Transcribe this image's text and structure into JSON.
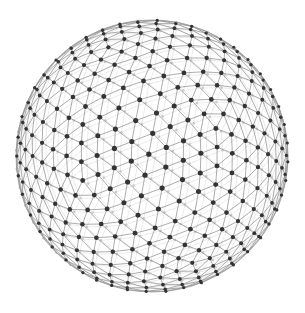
{
  "image": {
    "subject": "geodesic wireframe sphere",
    "background": "#ffffff",
    "width": 305,
    "height": 313
  },
  "sphere": {
    "center_x": 152,
    "center_y": 156,
    "radius": 136,
    "subdivisions": 3,
    "rotation_x": 0.35,
    "rotation_y": 0.5,
    "edge_color_front": "#8a8a8a",
    "edge_color_back": "#d6d6d6",
    "node_color_front": "#333333",
    "node_color_back": "#c8c8c8",
    "node_radius_front": 2.6,
    "node_radius_back": 1.2
  }
}
